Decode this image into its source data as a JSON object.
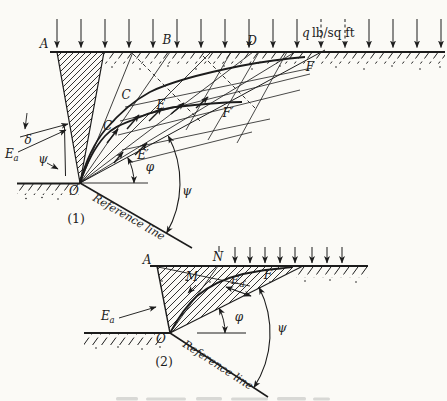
{
  "colors": {
    "ink": "#1c1c1c",
    "paper": "#fbfaf6"
  },
  "diagram1": {
    "index_label": "(1)",
    "surcharge": {
      "q": "q",
      "units": "lb/sq ft"
    },
    "surface_points": {
      "A": "A",
      "B": "B",
      "D": "D"
    },
    "curve_points": {
      "C": "C",
      "E": "E",
      "F": "F",
      "C_prime": "C′",
      "E_prime": "E′",
      "F_prime": "F′"
    },
    "origin": "O",
    "angles": {
      "delta": "δ",
      "psi_wall": "ψ",
      "phi": "φ",
      "psi_main": "ψ"
    },
    "ea": {
      "base": "E",
      "sub": "a"
    },
    "reference_line": "Reference line"
  },
  "diagram2": {
    "index_label": "(2)",
    "surface_points": {
      "A": "A",
      "N": "N",
      "F": "F"
    },
    "curve_points": {
      "M": "M"
    },
    "origin": "O",
    "angles": {
      "phi": "φ",
      "psi": "ψ"
    },
    "ea_outer": {
      "base": "E",
      "sub": "a"
    },
    "ea_inner": {
      "base": "E",
      "sub": "a"
    },
    "reference_line": "Reference line"
  }
}
